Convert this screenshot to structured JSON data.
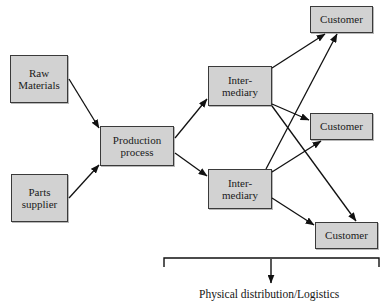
{
  "diagram": {
    "title_caption": "Physical distribution/Logistics",
    "nodes": [
      {
        "id": "raw-materials",
        "label": "Raw\nMaterials",
        "x": 10,
        "y": 55,
        "w": 58,
        "h": 48
      },
      {
        "id": "parts-supplier",
        "label": "Parts\nsupplier",
        "x": 11,
        "y": 174,
        "w": 57,
        "h": 48
      },
      {
        "id": "production-process",
        "label": "Production\nprocess",
        "x": 100,
        "y": 126,
        "w": 74,
        "h": 40
      },
      {
        "id": "intermediary-upper",
        "label": "Inter-\nmediary",
        "x": 208,
        "y": 66,
        "w": 64,
        "h": 40
      },
      {
        "id": "intermediary-lower",
        "label": "Inter-\nmediary",
        "x": 208,
        "y": 169,
        "w": 64,
        "h": 40
      },
      {
        "id": "customer-top",
        "label": "Customer",
        "x": 310,
        "y": 6,
        "w": 63,
        "h": 27
      },
      {
        "id": "customer-middle",
        "label": "Customer",
        "x": 310,
        "y": 113,
        "w": 63,
        "h": 27
      },
      {
        "id": "customer-bottom",
        "label": "Customer",
        "x": 315,
        "y": 222,
        "w": 63,
        "h": 27
      }
    ],
    "edges": [
      {
        "id": "raw-to-production",
        "from": "raw-materials",
        "to": "production-process"
      },
      {
        "id": "parts-to-production",
        "from": "parts-supplier",
        "to": "production-process"
      },
      {
        "id": "production-to-intermediary-upper",
        "from": "production-process",
        "to": "intermediary-upper"
      },
      {
        "id": "production-to-intermediary-lower",
        "from": "production-process",
        "to": "intermediary-lower"
      },
      {
        "id": "intermediary-upper-to-customer-top",
        "from": "intermediary-upper",
        "to": "customer-top"
      },
      {
        "id": "intermediary-upper-to-customer-middle",
        "from": "intermediary-upper",
        "to": "customer-middle"
      },
      {
        "id": "intermediary-upper-to-customer-bottom",
        "from": "intermediary-upper",
        "to": "customer-bottom"
      },
      {
        "id": "intermediary-lower-to-customer-top",
        "from": "intermediary-lower",
        "to": "customer-top"
      },
      {
        "id": "intermediary-lower-to-customer-middle",
        "from": "intermediary-lower",
        "to": "customer-middle"
      },
      {
        "id": "intermediary-lower-to-customer-bottom",
        "from": "intermediary-lower",
        "to": "customer-bottom"
      }
    ],
    "bracket": {
      "left_x": 164,
      "right_x": 379,
      "top_y": 258,
      "tick_bottom_y": 267,
      "arrow_x": 271,
      "arrow_y": 284
    },
    "colors": {
      "node_fill": "#d2d2d2",
      "node_border": "#3a3a3a",
      "line": "#111111",
      "text": "#141414",
      "background": "#ffffff"
    }
  }
}
